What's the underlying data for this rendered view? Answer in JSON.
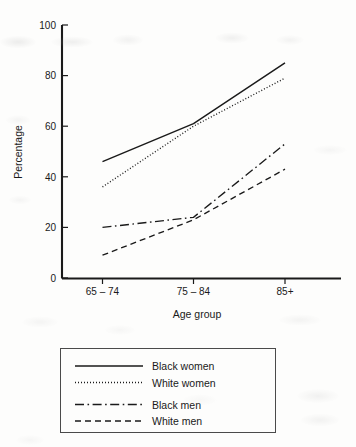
{
  "chart_data": {
    "type": "line",
    "title": "",
    "xlabel": "Age group",
    "ylabel": "Percentage",
    "categories": [
      "65 – 74",
      "75 – 84",
      "85+"
    ],
    "ylim": [
      0,
      100
    ],
    "yticks": [
      0,
      20,
      40,
      60,
      80,
      100
    ],
    "ytick_labels": [
      "0",
      "20",
      "40",
      "60",
      "80",
      "100"
    ],
    "grid": false,
    "legend_position": "below-plot",
    "series": [
      {
        "name": "Black women",
        "style": "solid",
        "color": "#1a1a1a",
        "values": [
          46,
          61,
          85
        ]
      },
      {
        "name": "White women",
        "style": "dotted",
        "color": "#1a1a1a",
        "values": [
          36,
          60,
          79
        ]
      },
      {
        "name": "Black men",
        "style": "dashdot",
        "color": "#1a1a1a",
        "values": [
          20,
          24,
          53
        ]
      },
      {
        "name": "White men",
        "style": "dashed",
        "color": "#1a1a1a",
        "values": [
          9,
          23,
          43
        ]
      }
    ]
  },
  "axes": {
    "y_axis_title": "Percentage",
    "x_axis_title": "Age group",
    "y_tick_0": "0",
    "y_tick_20": "20",
    "y_tick_40": "40",
    "y_tick_60": "60",
    "y_tick_80": "80",
    "y_tick_100": "100",
    "x_tick_1": "65 – 74",
    "x_tick_2": "75 – 84",
    "x_tick_3": "85+"
  },
  "legend": {
    "items": [
      {
        "label": "Black women"
      },
      {
        "label": "White women"
      },
      {
        "label": "Black men"
      },
      {
        "label": "White men"
      }
    ]
  }
}
